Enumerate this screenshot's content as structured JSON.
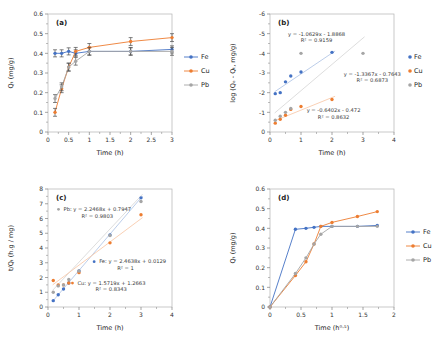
{
  "colors": {
    "fe": "#4472C4",
    "cu": "#ED7D31",
    "pb": "#A5A5A5",
    "fe_trend": "#B4C7E7",
    "cu_trend": "#F8CBAD",
    "pb_trend": "#D9D9D9"
  },
  "chart_data": [
    {
      "id": "a",
      "tag": "(a)",
      "type": "line",
      "xlabel": "Time (h)",
      "ylabel": "Qₜ (mg/g)",
      "xlim": [
        0,
        3
      ],
      "ylim": [
        0,
        0.6
      ],
      "xticks": [
        0,
        0.5,
        1,
        1.5,
        2,
        2.5,
        3
      ],
      "xticklabels": [
        "0",
        "0.5",
        "1",
        "1.5",
        "2",
        "2.5",
        "3"
      ],
      "yticks": [
        0,
        0.1,
        0.2,
        0.3,
        0.4,
        0.5,
        0.6
      ],
      "yticklabels": [
        "0",
        "0.1",
        "0.2",
        "0.3",
        "0.4",
        "0.5",
        "0.6"
      ],
      "legend": {
        "style": "line",
        "labels": [
          "Fe",
          "Cu",
          "Pb"
        ]
      },
      "x": [
        0.17,
        0.33,
        0.5,
        0.67,
        1,
        2,
        3
      ],
      "series": [
        {
          "name": "Fe",
          "color": "#4472C4",
          "line": true,
          "err": 0.018,
          "y": [
            0.4,
            0.4,
            0.41,
            0.4,
            0.41,
            0.41,
            0.42
          ]
        },
        {
          "name": "Cu",
          "color": "#ED7D31",
          "line": true,
          "err": 0.02,
          "y": [
            0.1,
            0.22,
            0.33,
            0.41,
            0.43,
            0.46,
            0.48
          ]
        },
        {
          "name": "Pb",
          "color": "#A5A5A5",
          "line": true,
          "err": 0.02,
          "y": [
            0.17,
            0.23,
            0.33,
            0.36,
            0.41,
            0.41,
            0.41
          ]
        }
      ]
    },
    {
      "id": "b",
      "tag": "(b)",
      "type": "scatter",
      "xlabel": "Time (h)",
      "ylabel": "log (Qₑ - Qₜ, mg/g)",
      "xlim": [
        0,
        4
      ],
      "ylim": [
        0,
        -6
      ],
      "xticks": [
        0,
        1,
        2,
        3,
        4
      ],
      "xticklabels": [
        "0",
        "1",
        "2",
        "3",
        "4"
      ],
      "yticks": [
        0,
        -1,
        -2,
        -3,
        -4,
        -5,
        -6
      ],
      "yticklabels": [
        "0",
        "-1",
        "-2",
        "-3",
        "-4",
        "-5",
        "-6"
      ],
      "legend": {
        "style": "dot",
        "labels": [
          "Fe",
          "Cu",
          "Pb"
        ]
      },
      "series": [
        {
          "name": "Fe",
          "color": "#4472C4",
          "x": [
            0.17,
            0.33,
            0.5,
            0.67,
            1,
            2
          ],
          "y": [
            -1.95,
            -2.0,
            -2.55,
            -2.85,
            -3.05,
            -4.05
          ]
        },
        {
          "name": "Cu",
          "color": "#ED7D31",
          "x": [
            0.17,
            0.33,
            0.5,
            0.67,
            1,
            2
          ],
          "y": [
            -0.45,
            -0.65,
            -0.85,
            -1.15,
            -1.3,
            -1.65
          ]
        },
        {
          "name": "Pb",
          "color": "#A5A5A5",
          "x": [
            0.17,
            0.33,
            0.5,
            0.67,
            1,
            3
          ],
          "y": [
            -0.6,
            -0.8,
            -1.0,
            -1.2,
            -4.0,
            -4.0
          ]
        }
      ],
      "trendlines": [
        {
          "series": "Fe",
          "color": "#B4C7E7",
          "m": -1.0629,
          "b": -1.8868,
          "x1": 0.15,
          "x2": 2.1
        },
        {
          "series": "Pb",
          "color": "#D9D9D9",
          "m": -1.3367,
          "b": -0.7643,
          "x1": 0.15,
          "x2": 3.05
        },
        {
          "series": "Cu",
          "color": "#F8CBAD",
          "m": -0.6402,
          "b": -0.472,
          "x1": 0.15,
          "x2": 2.1
        }
      ],
      "annotations": [
        {
          "anchor": "middle",
          "x": 1.5,
          "y": -4.9,
          "lines": [
            "y = -1.0629x - 1.8868",
            "R² = 0.9159"
          ]
        },
        {
          "anchor": "middle",
          "x": 3.3,
          "y": -2.85,
          "lines": [
            "y = -1.3367x - 0.7643",
            "R² = 0.6873"
          ]
        },
        {
          "anchor": "middle",
          "x": 2.05,
          "y": -1.0,
          "lines": [
            "y = -0.6402x - 0.472",
            "R² = 0.8632"
          ]
        }
      ]
    },
    {
      "id": "c",
      "tag": "(c)",
      "type": "scatter",
      "xlabel": "Time (h)",
      "ylabel": "t/Qₜ (h.g / mg)",
      "xlim": [
        0,
        4
      ],
      "ylim": [
        0,
        8
      ],
      "xticks": [
        0,
        1,
        2,
        3,
        4
      ],
      "xticklabels": [
        "0",
        "1",
        "2",
        "3",
        "4"
      ],
      "yticks": [
        0,
        1,
        2,
        3,
        4,
        5,
        6,
        7,
        8
      ],
      "yticklabels": [
        "0",
        "1",
        "2",
        "3",
        "4",
        "5",
        "6",
        "7",
        "8"
      ],
      "series": [
        {
          "name": "Fe",
          "color": "#4472C4",
          "x": [
            0.17,
            0.33,
            0.5,
            0.67,
            1,
            2,
            3
          ],
          "y": [
            0.43,
            0.83,
            1.22,
            1.63,
            2.44,
            4.88,
            7.4
          ]
        },
        {
          "name": "Cu",
          "color": "#ED7D31",
          "x": [
            0.17,
            0.33,
            0.5,
            0.67,
            1,
            2,
            3
          ],
          "y": [
            1.8,
            1.5,
            1.5,
            1.63,
            2.33,
            4.35,
            6.25
          ]
        },
        {
          "name": "Pb",
          "color": "#A5A5A5",
          "x": [
            0.17,
            0.33,
            0.5,
            0.67,
            1,
            2,
            3
          ],
          "y": [
            1.0,
            1.43,
            1.5,
            1.86,
            2.44,
            4.85,
            7.15
          ]
        }
      ],
      "trendlines": [
        {
          "series": "Fe",
          "color": "#B4C7E7",
          "m": 2.4638,
          "b": 0.0129,
          "x1": 0.15,
          "x2": 3.05
        },
        {
          "series": "Pb",
          "color": "#D9D9D9",
          "m": 2.2468,
          "b": 0.7947,
          "x1": 0.15,
          "x2": 3.05
        },
        {
          "series": "Cu",
          "color": "#F8CBAD",
          "m": 1.5719,
          "b": 1.2663,
          "x1": 0.15,
          "x2": 3.05
        }
      ],
      "annotations": [
        {
          "anchor": "start",
          "dot": "#A5A5A5",
          "x": 0.5,
          "y": 6.5,
          "lines": [
            "Pb:   y = 2.2468x + 0.7947",
            "R² = 0.9803"
          ]
        },
        {
          "anchor": "start",
          "dot": "#4472C4",
          "x": 1.65,
          "y": 2.95,
          "lines": [
            "Fe:   y = 2.4638x + 0.0129",
            "R² = 1"
          ]
        },
        {
          "anchor": "start",
          "dot": "#ED7D31",
          "x": 0.95,
          "y": 1.5,
          "lines": [
            "Cu:   y = 1.5719x + 1.2663",
            "R² = 0.8343"
          ]
        }
      ]
    },
    {
      "id": "d",
      "tag": "(d)",
      "type": "line",
      "xlabel": "Time (h⁰·⁵)",
      "ylabel": "Qₜ (mg/g)",
      "xlim": [
        0,
        2
      ],
      "ylim": [
        0,
        0.6
      ],
      "xticks": [
        0,
        0.5,
        1,
        1.5,
        2
      ],
      "xticklabels": [
        "0",
        "0.5",
        "1",
        "1.5",
        "2"
      ],
      "yticks": [
        0,
        0.1,
        0.2,
        0.3,
        0.4,
        0.5,
        0.6
      ],
      "yticklabels": [
        "0",
        "0.1",
        "0.2",
        "0.3",
        "0.4",
        "0.5",
        "0.6"
      ],
      "legend": {
        "style": "line",
        "labels": [
          "Fe",
          "Cu",
          "Pb"
        ]
      },
      "x": [
        0,
        0.41,
        0.58,
        0.71,
        0.82,
        1,
        1.41,
        1.73
      ],
      "series": [
        {
          "name": "Fe",
          "color": "#4472C4",
          "line": true,
          "y": [
            0,
            0.395,
            0.4,
            0.405,
            0.41,
            0.41,
            0.41,
            0.415
          ]
        },
        {
          "name": "Cu",
          "color": "#ED7D31",
          "line": true,
          "y": [
            0,
            0.16,
            0.23,
            0.32,
            0.41,
            0.43,
            0.46,
            0.485
          ]
        },
        {
          "name": "Pb",
          "color": "#A5A5A5",
          "line": true,
          "y": [
            0,
            0.17,
            0.25,
            0.32,
            0.37,
            0.41,
            0.41,
            0.41
          ]
        }
      ]
    }
  ]
}
